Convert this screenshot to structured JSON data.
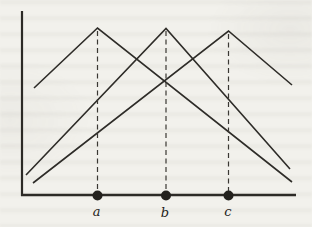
{
  "figure": {
    "colors": {
      "background": "#f2f1ec",
      "line": "#2e2c28",
      "dot": "#23211d"
    },
    "axes": {
      "y_axis_path": "M22,11 L22,196",
      "x_axis_path": "M21,195 L296,195"
    },
    "tents": [
      {
        "id": "tent-a",
        "path": "M34,88 L97.5,28 L292,182"
      },
      {
        "id": "tent-b",
        "path": "M26,175 L166,28.5 L290,169"
      },
      {
        "id": "tent-c",
        "path": "M33,183 L228.5,31 L292,85"
      }
    ],
    "dashed_lines": [
      {
        "id": "dash-a",
        "path": "M97.5,31 L97.5,193"
      },
      {
        "id": "dash-b",
        "path": "M166,31 L166,193"
      },
      {
        "id": "dash-c",
        "path": "M228.5,34 L228.5,193"
      }
    ],
    "points": [
      {
        "label": "a",
        "dot_transform": "translate(97.5,195.5)",
        "label_transform": "translate(96.5,216)"
      },
      {
        "label": "b",
        "dot_transform": "translate(166,195.5)",
        "label_transform": "translate(165,217)"
      },
      {
        "label": "c",
        "dot_transform": "translate(228.5,195.5)",
        "label_transform": "translate(228,216)"
      }
    ]
  }
}
